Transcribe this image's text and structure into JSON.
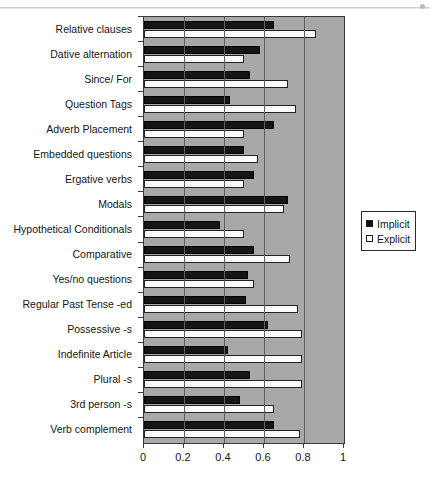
{
  "chart_data": {
    "type": "bar",
    "orientation": "horizontal",
    "title": "",
    "xlabel": "",
    "ylabel": "",
    "xlim": [
      0,
      1
    ],
    "xticks": [
      "0",
      "0.2",
      "0.4",
      "0.6",
      "0.8",
      "1"
    ],
    "xtick_values": [
      0,
      0.2,
      0.4,
      0.6,
      0.8,
      1
    ],
    "grid": true,
    "grid_axis": "x",
    "legend_position": "right",
    "plot_background": "#a8a8a8",
    "categories": [
      "Relative clauses",
      "Dative alternation",
      "Since/ For",
      "Question Tags",
      "Adverb Placement",
      "Embedded questions",
      "Ergative verbs",
      "Modals",
      "Hypothetical Conditionals",
      "Comparative",
      "Yes/no questions",
      "Regular Past Tense -ed",
      "Possessive -s",
      "Indefinite Article",
      "Plural -s",
      "3rd person -s",
      "Verb complement"
    ],
    "series": [
      {
        "name": "Implicit",
        "color": "#151515",
        "values": [
          0.65,
          0.58,
          0.53,
          0.43,
          0.65,
          0.5,
          0.55,
          0.72,
          0.38,
          0.55,
          0.52,
          0.51,
          0.62,
          0.42,
          0.53,
          0.48,
          0.65
        ]
      },
      {
        "name": "Explicit",
        "color": "#fbfbfb",
        "values": [
          0.86,
          0.5,
          0.72,
          0.76,
          0.5,
          0.57,
          0.5,
          0.7,
          0.5,
          0.73,
          0.55,
          0.77,
          0.79,
          0.79,
          0.79,
          0.65,
          0.78
        ]
      }
    ]
  },
  "legend": {
    "items": [
      {
        "label": "Implicit",
        "swatch": "filled-square-icon"
      },
      {
        "label": "Explicit",
        "swatch": "hollow-square-icon"
      }
    ]
  }
}
